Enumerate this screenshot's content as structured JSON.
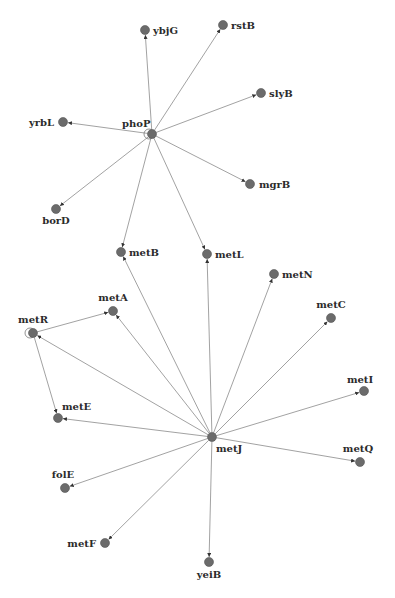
{
  "graph": {
    "type": "gene-regulatory-network",
    "colors": {
      "node": "#6b6b6b",
      "edge": "#8a8a8a",
      "label": "#2b2b2b"
    },
    "nodes": [
      {
        "id": "phoP",
        "label": "phoP",
        "self_loop": true
      },
      {
        "id": "ybjG",
        "label": "ybjG"
      },
      {
        "id": "rstB",
        "label": "rstB"
      },
      {
        "id": "slyB",
        "label": "slyB"
      },
      {
        "id": "yrbL",
        "label": "yrbL"
      },
      {
        "id": "mgrB",
        "label": "mgrB"
      },
      {
        "id": "borD",
        "label": "borD"
      },
      {
        "id": "metB",
        "label": "metB"
      },
      {
        "id": "metL",
        "label": "metL"
      },
      {
        "id": "metN",
        "label": "metN"
      },
      {
        "id": "metA",
        "label": "metA"
      },
      {
        "id": "metR",
        "label": "metR",
        "self_loop": true
      },
      {
        "id": "metC",
        "label": "metC"
      },
      {
        "id": "metE",
        "label": "metE"
      },
      {
        "id": "metI",
        "label": "metI"
      },
      {
        "id": "metJ",
        "label": "metJ"
      },
      {
        "id": "metQ",
        "label": "metQ"
      },
      {
        "id": "folE",
        "label": "folE"
      },
      {
        "id": "metF",
        "label": "metF"
      },
      {
        "id": "yeiB",
        "label": "yeiB"
      }
    ],
    "edges": [
      {
        "source": "phoP",
        "target": "ybjG"
      },
      {
        "source": "phoP",
        "target": "rstB"
      },
      {
        "source": "phoP",
        "target": "slyB"
      },
      {
        "source": "phoP",
        "target": "yrbL"
      },
      {
        "source": "phoP",
        "target": "mgrB"
      },
      {
        "source": "phoP",
        "target": "borD"
      },
      {
        "source": "phoP",
        "target": "metB"
      },
      {
        "source": "phoP",
        "target": "metL"
      },
      {
        "source": "metR",
        "target": "metA"
      },
      {
        "source": "metR",
        "target": "metE"
      },
      {
        "source": "metJ",
        "target": "metR"
      },
      {
        "source": "metJ",
        "target": "metA"
      },
      {
        "source": "metJ",
        "target": "metB"
      },
      {
        "source": "metJ",
        "target": "metL"
      },
      {
        "source": "metJ",
        "target": "metN"
      },
      {
        "source": "metJ",
        "target": "metC"
      },
      {
        "source": "metJ",
        "target": "metI"
      },
      {
        "source": "metJ",
        "target": "metQ"
      },
      {
        "source": "metJ",
        "target": "metE"
      },
      {
        "source": "metJ",
        "target": "folE"
      },
      {
        "source": "metJ",
        "target": "metF"
      },
      {
        "source": "metJ",
        "target": "yeiB"
      }
    ]
  }
}
